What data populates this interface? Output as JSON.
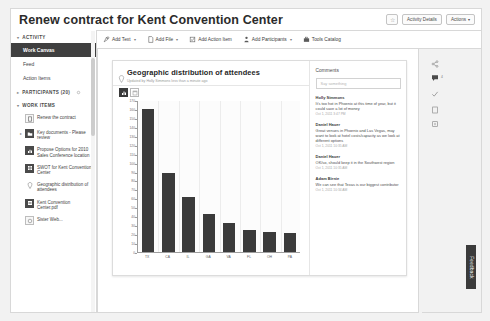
{
  "header": {
    "title": "Renew contract for Kent Convention Center",
    "star_icon": "star-icon",
    "activity_details_label": "Activity Details",
    "actions_label": "Actions",
    "actions_caret": "↕"
  },
  "toolbar": {
    "items": [
      {
        "label": "Add Text",
        "icon": "add-text-icon",
        "caret": "▾"
      },
      {
        "label": "Add File",
        "icon": "add-file-icon",
        "caret": "▾"
      },
      {
        "label": "Add Action Item",
        "icon": "add-action-item-icon",
        "caret": ""
      },
      {
        "label": "Add Participants",
        "icon": "add-participants-icon",
        "caret": "▾"
      },
      {
        "label": "Tools Catalog",
        "icon": "tools-catalog-icon",
        "caret": ""
      }
    ]
  },
  "sidebar": {
    "activity_section": "ACTIVITY",
    "activity_items": [
      {
        "label": "Work Canvas",
        "active": true
      },
      {
        "label": "Feed",
        "active": false
      },
      {
        "label": "Action Items",
        "active": false
      }
    ],
    "participants_section": "PARTICIPANTS (20)",
    "work_items_section": "WORK ITEMS",
    "work_items": [
      {
        "label": "Renew the contract",
        "icon": "document-icon",
        "dark": false,
        "bullet": ""
      },
      {
        "label": "Key documents - Please review",
        "icon": "folder-icon",
        "dark": true,
        "bullet": "▸"
      },
      {
        "label": "Propose Options for 2010 Sales Conference location",
        "icon": "chart-icon",
        "dark": true,
        "bullet": ""
      },
      {
        "label": "SWOT for Kent Convention Center",
        "icon": "grid-icon",
        "dark": true,
        "bullet": ""
      },
      {
        "label": "Geographic distribution of attendees",
        "icon": "pin-icon",
        "dark": false,
        "bullet": ""
      },
      {
        "label": "Kent Convention Center.pdf",
        "icon": "pdf-icon",
        "dark": true,
        "bullet": ""
      },
      {
        "label": "Sister Web...",
        "icon": "link-icon",
        "dark": false,
        "bullet": ""
      }
    ]
  },
  "card": {
    "title": "Geographic distribution of attendees",
    "subtitle": "Updated by Holly Simmons less than a minute ago",
    "pin_icon": "pin-icon",
    "chart_buttons": [
      {
        "name": "bar-chart-view",
        "selected": true
      },
      {
        "name": "table-view",
        "selected": false
      }
    ]
  },
  "chart_data": {
    "type": "bar",
    "title": "Geographic distribution of attendees",
    "categories": [
      "TX",
      "CA",
      "IL",
      "GA",
      "VA",
      "FL",
      "OH",
      "PA"
    ],
    "values": [
      160,
      88,
      62,
      42,
      33,
      25,
      22,
      21
    ],
    "xlabel": "",
    "ylabel": "",
    "ylim": [
      0,
      170
    ],
    "yticks": [
      0,
      10,
      20,
      30,
      40,
      50,
      60,
      70,
      80,
      90,
      100,
      110,
      120,
      130,
      140,
      150,
      160,
      170
    ],
    "grid": true,
    "legend": "none",
    "bar_color": "#3b3b3b"
  },
  "comments": {
    "title": "Comments",
    "input_placeholder": "Say something",
    "list": [
      {
        "author": "Holly Simmons",
        "body": "It's too hot in Phoenix at this time of year, but it could save a lot of money",
        "time": "Oct 1, 2011 3:47 PM"
      },
      {
        "author": "Daniel Hauer",
        "body": "Great venues in Phoenix and Las Vegas, may want to look at hotel costs/capacity as we look at different options",
        "time": "Oct 1, 2011 10:35 AM"
      },
      {
        "author": "Daniel Hauer",
        "body": "OK/so, should keep it in the Southwest region",
        "time": "Oct 1, 2011 10:35 AM"
      },
      {
        "author": "Adam Birnie",
        "body": "We can see that Texas is our biggest contributor",
        "time": "Oct 1, 2011 10:34 AM"
      }
    ]
  },
  "rail": {
    "icons": [
      {
        "name": "share-icon",
        "badge": ""
      },
      {
        "name": "comment-icon",
        "badge": "4"
      },
      {
        "name": "check-icon",
        "badge": ""
      },
      {
        "name": "document-icon",
        "badge": ""
      },
      {
        "name": "info-icon",
        "badge": ""
      }
    ],
    "feedback_label": "Feedback"
  }
}
